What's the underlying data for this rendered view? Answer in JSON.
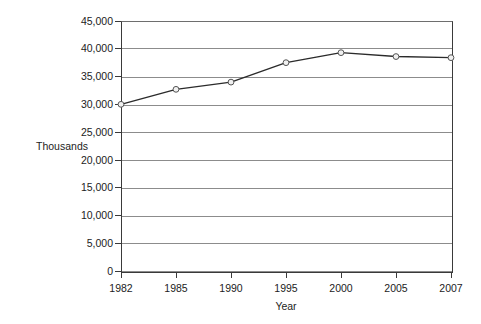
{
  "chart_data": {
    "type": "line",
    "title": "",
    "subtitle": "",
    "xlabel": "Year",
    "ylabel": "Thousands",
    "categories": [
      "1982",
      "1985",
      "1990",
      "1995",
      "2000",
      "2005",
      "2007"
    ],
    "x": [
      1982,
      1985,
      1990,
      1995,
      2000,
      2005,
      2007
    ],
    "values": [
      30000,
      32700,
      34000,
      37500,
      39300,
      38600,
      38400
    ],
    "series": [
      {
        "name": "",
        "values": [
          30000,
          32700,
          34000,
          37500,
          39300,
          38600,
          38400
        ]
      }
    ],
    "ylim": [
      0,
      45000
    ],
    "ytick_labels": [
      "0",
      "5,000",
      "10,000",
      "15,000",
      "20,000",
      "25,000",
      "30,000",
      "35,000",
      "40,000",
      "45,000"
    ],
    "ytick_values": [
      0,
      5000,
      10000,
      15000,
      20000,
      25000,
      30000,
      35000,
      40000,
      45000
    ],
    "xtick_labels": [
      "1982",
      "1985",
      "1990",
      "1995",
      "2000",
      "2005",
      "2007"
    ],
    "grid": "horizontal",
    "legend": "none",
    "x_axis_scale": "categorical",
    "colors": {
      "line": "#2b2b2b",
      "marker_fill": "#f0f0f0",
      "marker_stroke": "#555555",
      "gridline": "#8c8c8c",
      "axis": "#3a3a3a",
      "text": "#1c1c1c",
      "background": "#ffffff"
    }
  }
}
